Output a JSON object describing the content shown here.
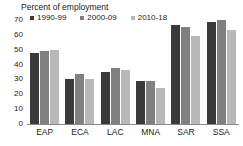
{
  "chart_data": {
    "type": "bar",
    "title": "Percent of employment",
    "xlabel": "",
    "ylabel": "",
    "ylim": [
      0,
      70
    ],
    "yticks": [
      70,
      60,
      50,
      40,
      30,
      20,
      10,
      0
    ],
    "grid": false,
    "legend_position": "top",
    "categories": [
      "EAP",
      "ECA",
      "LAC",
      "MNA",
      "SAR",
      "SSA"
    ],
    "series": [
      {
        "name": "1990-99",
        "color": "#3a3a3a",
        "values": [
          48,
          30.5,
          35,
          29,
          66.5,
          68.5
        ]
      },
      {
        "name": "2000-09",
        "color": "#808080",
        "values": [
          49,
          33.5,
          38,
          29,
          65.5,
          70
        ]
      },
      {
        "name": "2010-18",
        "color": "#b8b8b8",
        "values": [
          50,
          30.5,
          36.5,
          24,
          59.5,
          63
        ]
      }
    ]
  },
  "axis": {
    "line_color": "#8a8a8a"
  }
}
